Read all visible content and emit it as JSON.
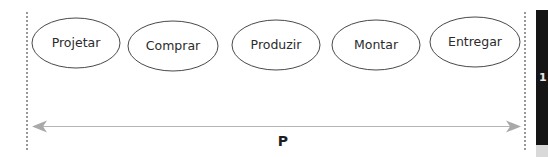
{
  "diagram": {
    "steps": [
      {
        "label": "Projetar",
        "cx": 76,
        "cy": 43,
        "rx": 44,
        "ry": 25
      },
      {
        "label": "Comprar",
        "cx": 173,
        "cy": 46,
        "rx": 45,
        "ry": 25
      },
      {
        "label": "Produzir",
        "cx": 276,
        "cy": 45,
        "rx": 44,
        "ry": 25
      },
      {
        "label": "Montar",
        "cx": 376,
        "cy": 45,
        "rx": 44,
        "ry": 25
      },
      {
        "label": "Entregar",
        "cx": 475,
        "cy": 42,
        "rx": 45,
        "ry": 25
      }
    ],
    "span_arrow": {
      "label": "P",
      "direction": "bidirectional",
      "color": "#a9a9a9"
    },
    "boundaries": {
      "style": "dashed",
      "color": "#555555"
    },
    "side_panel": {
      "glyph": "1",
      "background": "#151515",
      "footer_color": "#d9d9d9"
    }
  }
}
